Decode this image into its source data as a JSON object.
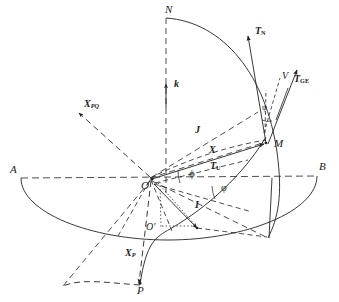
{
  "figure": {
    "background_color": "#ffffff",
    "stroke_color": "#222222",
    "canvas": {
      "width": 339,
      "height": 302
    }
  },
  "points": [
    {
      "name": "N",
      "label": "N",
      "desc": "north pole direction top of vertical axis",
      "x": 165,
      "y": 8
    },
    {
      "name": "A",
      "label": "A",
      "desc": "left end of horizontal equatorial line",
      "x": 12,
      "y": 168
    },
    {
      "name": "B",
      "label": "B",
      "desc": "right end of horizontal equatorial line",
      "x": 320,
      "y": 166
    },
    {
      "name": "O",
      "label": "O",
      "desc": "origin center of sphere",
      "x": 147,
      "y": 182
    },
    {
      "name": "O-prime",
      "label": "O'",
      "desc": "projected origin on lower ellipse",
      "x": 150,
      "y": 228
    },
    {
      "name": "M",
      "label": "M",
      "desc": "point on sphere surface",
      "x": 267,
      "y": 144
    },
    {
      "name": "P",
      "label": "P",
      "desc": "lower point on dashed great circle",
      "x": 140,
      "y": 285
    },
    {
      "name": "V",
      "label": "V",
      "desc": "velocity direction label",
      "x": 284,
      "y": 77
    }
  ],
  "vectors": [
    {
      "name": "k",
      "label": "k",
      "sub": "",
      "upright_sub": false,
      "x": 176,
      "y": 84,
      "bold": true,
      "size": "sz10"
    },
    {
      "name": "J",
      "label": "J",
      "sub": "",
      "upright_sub": false,
      "x": 196,
      "y": 130,
      "bold": true,
      "size": "sz10"
    },
    {
      "name": "X",
      "label": "X",
      "sub": "",
      "upright_sub": false,
      "x": 210,
      "y": 150,
      "bold": true,
      "size": "sz10"
    },
    {
      "name": "I",
      "label": "I",
      "sub": "",
      "upright_sub": false,
      "x": 196,
      "y": 205,
      "bold": true,
      "size": "sz10"
    },
    {
      "name": "X-PQ",
      "label": "X",
      "sub": "PQ",
      "upright_sub": false,
      "x": 86,
      "y": 104,
      "bold": true,
      "size": "sz10"
    },
    {
      "name": "X-P",
      "label": "X",
      "sub": "P",
      "upright_sub": false,
      "x": 127,
      "y": 253,
      "bold": true,
      "size": "sz10"
    },
    {
      "name": "T-N",
      "label": "T",
      "sub": "N",
      "upright_sub": true,
      "x": 256,
      "y": 31,
      "bold": true,
      "size": "sz10"
    },
    {
      "name": "T-GE",
      "label": "T",
      "sub": "GE",
      "upright_sub": true,
      "x": 296,
      "y": 79,
      "bold": true,
      "size": "sz10"
    },
    {
      "name": "T-U",
      "label": "T",
      "sub": "U",
      "upright_sub": true,
      "x": 212,
      "y": 166,
      "bold": true,
      "size": "sz10"
    }
  ],
  "angles": [
    {
      "name": "phi",
      "label": "ϕ",
      "desc": "angle phi at origin from equator to X",
      "x": 190,
      "y": 168,
      "size": "sz11"
    },
    {
      "name": "varphi",
      "label": "φ",
      "desc": "angle varphi below equator line",
      "x": 222,
      "y": 182,
      "size": "sz10"
    },
    {
      "name": "psi",
      "label": "ψ",
      "desc": "angle psi between T_N and T_GE at M",
      "x": 264,
      "y": 103,
      "size": "sz8"
    }
  ],
  "line_styles": {
    "solid": "solid curves and vectors",
    "dashed": "dashed construction lines",
    "dotted": "dotted projection lines"
  }
}
